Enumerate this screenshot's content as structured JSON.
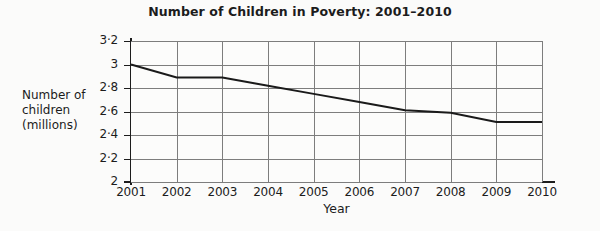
{
  "chart_data": {
    "type": "line",
    "title": "Number of Children in Poverty: 2001–2010",
    "xlabel": "Year",
    "ylabel": "Number of children (millions)",
    "ylabel_lines": [
      "Number of",
      "children",
      "(millions)"
    ],
    "categories": [
      "2001",
      "2002",
      "2003",
      "2004",
      "2005",
      "2006",
      "2007",
      "2008",
      "2009",
      "2010"
    ],
    "x": [
      2001,
      2002,
      2003,
      2004,
      2005,
      2006,
      2007,
      2008,
      2009,
      2010
    ],
    "values": [
      3.0,
      2.89,
      2.89,
      2.82,
      2.75,
      2.68,
      2.61,
      2.59,
      2.51,
      2.51
    ],
    "series": [
      {
        "name": "Number of children (millions)",
        "values": [
          3.0,
          2.89,
          2.89,
          2.82,
          2.75,
          2.68,
          2.61,
          2.59,
          2.51,
          2.51
        ]
      }
    ],
    "ylim": [
      2.0,
      3.2
    ],
    "xlim": [
      2001,
      2010
    ],
    "ytick_labels": [
      "3·2",
      "3",
      "2·8",
      "2·6",
      "2·4",
      "2·2",
      "2"
    ],
    "ytick_values": [
      3.2,
      3.0,
      2.8,
      2.6,
      2.4,
      2.2,
      2.0
    ],
    "grid": true,
    "legend": false,
    "legend_position": "none",
    "line_color": "#1a1a1a",
    "grid_color": "#7d7d7d",
    "axis_color": "#1c1c1c",
    "background_color": "#fbfbfa"
  }
}
